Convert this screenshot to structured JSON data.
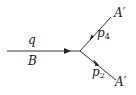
{
  "diagram": {
    "type": "feynman-vertex",
    "line_color": "#333333",
    "incoming": {
      "label_above": "q",
      "label_below": "B"
    },
    "outgoing_upper": {
      "momentum_label": "p",
      "momentum_sub": "4",
      "particle_label": "A′"
    },
    "outgoing_lower": {
      "momentum_label": "p",
      "momentum_sub": "2",
      "particle_label": "A′"
    }
  }
}
